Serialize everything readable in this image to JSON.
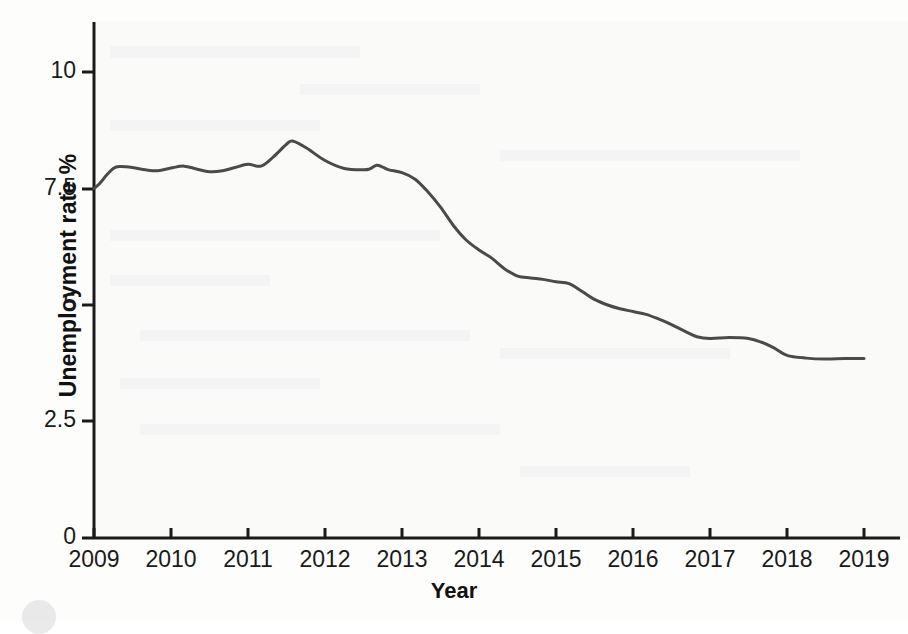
{
  "chart_data": {
    "type": "line",
    "title": "",
    "xlabel": "Year",
    "ylabel": "Unemployment rate %",
    "xlim": [
      2009,
      2019
    ],
    "ylim": [
      0,
      10.6
    ],
    "grid": false,
    "legend": "none",
    "line_color": "#4a4a4a",
    "axis_color": "#1a1a1a",
    "background_color": "#fdfdfc",
    "y_ticks": [
      "0",
      "2.5",
      "5",
      "7.5",
      "10"
    ],
    "y_tick_values": [
      0,
      2.5,
      5,
      7.5,
      10
    ],
    "x_ticks": [
      "2009",
      "2010",
      "2011",
      "2012",
      "2013",
      "2014",
      "2015",
      "2016",
      "2017",
      "2018",
      "2019"
    ],
    "x_tick_values": [
      2009,
      2010,
      2011,
      2012,
      2013,
      2014,
      2015,
      2016,
      2017,
      2018,
      2019
    ],
    "series": [
      {
        "name": "Unemployment rate %",
        "x": [
          2009.0,
          2009.08,
          2009.17,
          2009.25,
          2009.33,
          2009.5,
          2009.67,
          2009.83,
          2010.0,
          2010.17,
          2010.33,
          2010.5,
          2010.67,
          2010.83,
          2011.0,
          2011.17,
          2011.33,
          2011.5,
          2011.58,
          2011.75,
          2012.0,
          2012.25,
          2012.5,
          2012.58,
          2012.67,
          2012.75,
          2012.83,
          2013.0,
          2013.17,
          2013.33,
          2013.5,
          2013.67,
          2013.83,
          2014.0,
          2014.17,
          2014.33,
          2014.5,
          2014.67,
          2014.83,
          2015.0,
          2015.17,
          2015.33,
          2015.5,
          2015.67,
          2015.83,
          2016.0,
          2016.17,
          2016.33,
          2016.5,
          2016.67,
          2016.83,
          2017.0,
          2017.25,
          2017.5,
          2017.67,
          2017.83,
          2018.0,
          2018.25,
          2018.5,
          2018.75,
          2019.0
        ],
        "y": [
          7.5,
          7.62,
          7.8,
          7.93,
          7.97,
          7.95,
          7.9,
          7.88,
          7.94,
          7.98,
          7.92,
          7.86,
          7.88,
          7.95,
          8.02,
          7.98,
          8.18,
          8.45,
          8.52,
          8.38,
          8.1,
          7.93,
          7.9,
          7.92,
          8.0,
          7.96,
          7.9,
          7.84,
          7.7,
          7.44,
          7.1,
          6.7,
          6.4,
          6.18,
          6.0,
          5.78,
          5.62,
          5.58,
          5.55,
          5.5,
          5.46,
          5.3,
          5.12,
          5.0,
          4.92,
          4.86,
          4.8,
          4.7,
          4.58,
          4.44,
          4.32,
          4.28,
          4.3,
          4.28,
          4.2,
          4.08,
          3.92,
          3.86,
          3.84,
          3.85,
          3.85
        ],
        "color": "#4a4a4a",
        "style": "solid",
        "width_px": 3
      }
    ],
    "annotations": {
      "start_value": 7.5,
      "start_year": 2009,
      "peak_value": 8.52,
      "peak_year": 2011.58,
      "end_value": 3.85,
      "end_year": 2019,
      "description": "Unemployment rate declines from about 7.5% in 2009, peaks near 8.5% in mid-2011, then falls steadily to about 3.85% by 2019."
    }
  },
  "axes": {
    "y_title": "Unemployment rate %",
    "x_title": "Year"
  }
}
